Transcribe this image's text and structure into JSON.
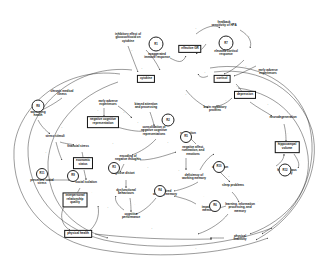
{
  "diagram": {
    "type": "causal-loop-diagram",
    "background": "#ffffff",
    "stroke": "#222222",
    "text_color": "#1a1a1a"
  },
  "nodes": [
    {
      "id": "n1",
      "label": "inhibitory effect of\nglucocorticoid on\ncytokine",
      "x": 128,
      "y": 38,
      "shape": "plain"
    },
    {
      "id": "n2",
      "label": "exaggerated\nimmune response",
      "x": 157,
      "y": 56,
      "shape": "plain"
    },
    {
      "id": "n3",
      "label": "cytokine",
      "x": 146,
      "y": 79,
      "shape": "box"
    },
    {
      "id": "n4",
      "label": "feedback\nsensitivity of HPA",
      "x": 224,
      "y": 24,
      "shape": "plain"
    },
    {
      "id": "n5",
      "label": "elevated cortisol\nresponse",
      "x": 226,
      "y": 53,
      "shape": "plain"
    },
    {
      "id": "n6",
      "label": "effective GR",
      "x": 190,
      "y": 49,
      "shape": "box"
    },
    {
      "id": "n7",
      "label": "early adverse\nexperiences",
      "x": 268,
      "y": 72,
      "shape": "plain"
    },
    {
      "id": "n8",
      "label": "cortisol",
      "x": 222,
      "y": 79,
      "shape": "box"
    },
    {
      "id": "n9",
      "label": "depression",
      "x": 245,
      "y": 95,
      "shape": "box"
    },
    {
      "id": "n10",
      "label": "brain regulatory\nproteins",
      "x": 215,
      "y": 109,
      "shape": "plain"
    },
    {
      "id": "n11",
      "label": "chronic medical\nillness",
      "x": 62,
      "y": 93,
      "shape": "plain"
    },
    {
      "id": "n12",
      "label": "worsening\nhealth",
      "x": 38,
      "y": 114,
      "shape": "plain"
    },
    {
      "id": "n13",
      "label": "stress stimuli",
      "x": 55,
      "y": 137,
      "shape": "plain"
    },
    {
      "id": "n14",
      "label": "financial stress",
      "x": 78,
      "y": 147,
      "shape": "plain"
    },
    {
      "id": "n15",
      "label": "early adverse\nexperiences",
      "x": 108,
      "y": 103,
      "shape": "plain"
    },
    {
      "id": "n16",
      "label": "negative cognitive\nrepresentation",
      "x": 103,
      "y": 122,
      "shape": "box"
    },
    {
      "id": "n17",
      "label": "biased attention\nand processing",
      "x": 146,
      "y": 106,
      "shape": "plain"
    },
    {
      "id": "n18",
      "label": "consolidation of\nnegative cognitive\nrepresentations",
      "x": 154,
      "y": 131,
      "shape": "plain"
    },
    {
      "id": "n19",
      "label": "encoding of\nnegative thoughts",
      "x": 128,
      "y": 158,
      "shape": "plain"
    },
    {
      "id": "n20",
      "label": "negative affect,\nrumination, and\nemotions",
      "x": 193,
      "y": 151,
      "shape": "plain"
    },
    {
      "id": "n21",
      "label": "rumination",
      "x": 188,
      "y": 134,
      "shape": "plain"
    },
    {
      "id": "n22",
      "label": "economic\nstatus",
      "x": 83,
      "y": 163,
      "shape": "box"
    },
    {
      "id": "n23",
      "label": "social isolation",
      "x": 86,
      "y": 183,
      "shape": "plain"
    },
    {
      "id": "n24",
      "label": "perceived social\nstress",
      "x": 42,
      "y": 182,
      "shape": "plain"
    },
    {
      "id": "n25",
      "label": "interpersonal\nrelationship\nquality",
      "x": 75,
      "y": 200,
      "shape": "box"
    },
    {
      "id": "n26",
      "label": "cognitive distort",
      "x": 123,
      "y": 174,
      "shape": "plain"
    },
    {
      "id": "n27",
      "label": "dysfunctional\nbehaviours",
      "x": 126,
      "y": 192,
      "shape": "plain"
    },
    {
      "id": "n28",
      "label": "cognitive\nperformance",
      "x": 131,
      "y": 216,
      "shape": "plain"
    },
    {
      "id": "n29",
      "label": "impaired\nworking memory",
      "x": 165,
      "y": 193,
      "shape": "plain"
    },
    {
      "id": "n30",
      "label": "deficiency of\nworking memory",
      "x": 194,
      "y": 177,
      "shape": "plain"
    },
    {
      "id": "n31",
      "label": "sleep problems",
      "x": 233,
      "y": 186,
      "shape": "plain"
    },
    {
      "id": "n32",
      "label": "sleep\ndeprivation",
      "x": 220,
      "y": 166,
      "shape": "plain"
    },
    {
      "id": "n33",
      "label": "learning, information\nprocessing, and\nmemory",
      "x": 240,
      "y": 208,
      "shape": "plain"
    },
    {
      "id": "n34",
      "label": "impaired\nmemory",
      "x": 208,
      "y": 209,
      "shape": "plain"
    },
    {
      "id": "n35",
      "label": "neurodegeneration",
      "x": 283,
      "y": 118,
      "shape": "plain"
    },
    {
      "id": "n36",
      "label": "hippocampal\nvolume",
      "x": 287,
      "y": 147,
      "shape": "box"
    },
    {
      "id": "n37",
      "label": "hippocampus\natrophy",
      "x": 287,
      "y": 172,
      "shape": "plain"
    },
    {
      "id": "n38",
      "label": "physical health",
      "x": 78,
      "y": 234,
      "shape": "box"
    },
    {
      "id": "n39",
      "label": "physical\ninactivity",
      "x": 240,
      "y": 238,
      "shape": "plain"
    }
  ],
  "loops": [
    {
      "id": "l1",
      "label": "R1",
      "x": 156,
      "y": 44,
      "r": 6.5
    },
    {
      "id": "l2",
      "label": "R7",
      "x": 226,
      "y": 43,
      "r": 6.5
    },
    {
      "id": "l3",
      "label": "R8",
      "x": 38,
      "y": 106,
      "r": 5.5
    },
    {
      "id": "l4",
      "label": "R2",
      "x": 168,
      "y": 120,
      "r": 5.5
    },
    {
      "id": "l5",
      "label": "R3",
      "x": 114,
      "y": 168,
      "r": 5.0
    },
    {
      "id": "l6",
      "label": "R11",
      "x": 42,
      "y": 174,
      "r": 5.0
    },
    {
      "id": "l7",
      "label": "R9",
      "x": 73,
      "y": 176,
      "r": 5.0
    },
    {
      "id": "l8",
      "label": "R5",
      "x": 186,
      "y": 137,
      "r": 5.0
    },
    {
      "id": "l9",
      "label": "R10",
      "x": 219,
      "y": 167,
      "r": 5.0
    },
    {
      "id": "l10",
      "label": "R4",
      "x": 160,
      "y": 191,
      "r": 5.0
    },
    {
      "id": "l11",
      "label": "R6",
      "x": 215,
      "y": 206,
      "r": 5.0
    },
    {
      "id": "l12",
      "label": "R12",
      "x": 285,
      "y": 170,
      "r": 5.5
    }
  ],
  "edge_signs": [
    {
      "label": "+",
      "x": 132,
      "y": 50
    },
    {
      "label": "+",
      "x": 142,
      "y": 68
    },
    {
      "label": "-",
      "x": 172,
      "y": 58
    },
    {
      "label": "+",
      "x": 196,
      "y": 28
    },
    {
      "label": "-",
      "x": 203,
      "y": 41
    },
    {
      "label": "+",
      "x": 249,
      "y": 36
    },
    {
      "label": "+",
      "x": 246,
      "y": 66
    },
    {
      "label": "+",
      "x": 205,
      "y": 72
    },
    {
      "label": "+",
      "x": 237,
      "y": 86
    },
    {
      "label": "+",
      "x": 226,
      "y": 100
    },
    {
      "label": "+",
      "x": 186,
      "y": 94
    },
    {
      "label": "+",
      "x": 98,
      "y": 110
    },
    {
      "label": "+",
      "x": 124,
      "y": 112
    },
    {
      "label": "+",
      "x": 138,
      "y": 122
    },
    {
      "label": "+",
      "x": 168,
      "y": 142
    },
    {
      "label": "+",
      "x": 113,
      "y": 143
    },
    {
      "label": "+",
      "x": 62,
      "y": 127
    },
    {
      "label": "+",
      "x": 46,
      "y": 152
    },
    {
      "label": "-",
      "x": 89,
      "y": 156
    },
    {
      "label": "-",
      "x": 92,
      "y": 192
    },
    {
      "label": "+",
      "x": 108,
      "y": 207
    },
    {
      "label": "+",
      "x": 148,
      "y": 167
    },
    {
      "label": "-",
      "x": 135,
      "y": 204
    },
    {
      "label": "+",
      "x": 179,
      "y": 170
    },
    {
      "label": "-",
      "x": 204,
      "y": 196
    },
    {
      "label": "+",
      "x": 229,
      "y": 176
    },
    {
      "label": "-",
      "x": 258,
      "y": 201
    },
    {
      "label": "+",
      "x": 268,
      "y": 104
    },
    {
      "label": "-",
      "x": 288,
      "y": 133
    },
    {
      "label": "-",
      "x": 300,
      "y": 160
    },
    {
      "label": "+",
      "x": 152,
      "y": 228
    },
    {
      "label": "+",
      "x": 196,
      "y": 248
    }
  ]
}
